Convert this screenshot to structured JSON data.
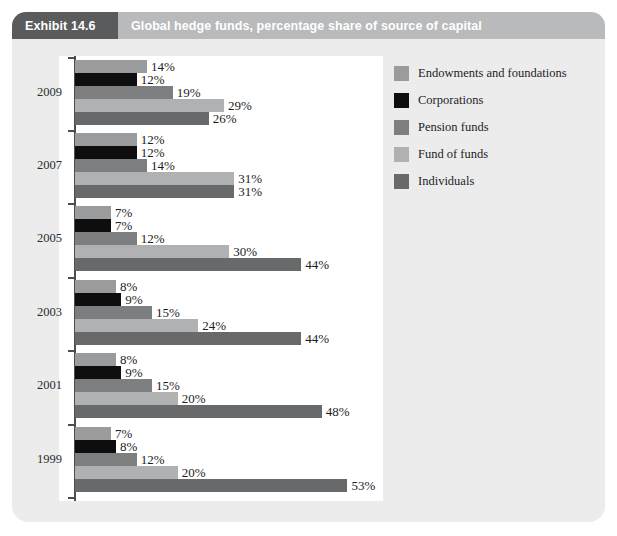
{
  "header": {
    "exhibit_tag": "Exhibit 14.6",
    "title": "Global hedge funds, percentage share of source of capital"
  },
  "legend": {
    "position": "right",
    "items": [
      {
        "label": "Endowments and foundations",
        "color": "#9a9b9d"
      },
      {
        "label": "Corporations",
        "color": "#0e0e0e"
      },
      {
        "label": "Pension funds",
        "color": "#7d7e80"
      },
      {
        "label": "Fund of funds",
        "color": "#b0b1b3"
      },
      {
        "label": "Individuals",
        "color": "#68696b"
      }
    ]
  },
  "chart_data": {
    "type": "bar",
    "orientation": "horizontal",
    "title": "Global hedge funds, percentage share of source of capital",
    "xlabel": "",
    "ylabel": "",
    "xlim": [
      0,
      60
    ],
    "grid": false,
    "value_suffix": "%",
    "categories": [
      "2009",
      "2007",
      "2005",
      "2003",
      "2001",
      "1999"
    ],
    "series": [
      {
        "name": "Endowments and foundations",
        "color": "#9a9b9d",
        "values": [
          14,
          12,
          7,
          8,
          8,
          7
        ]
      },
      {
        "name": "Corporations",
        "color": "#0e0e0e",
        "values": [
          12,
          12,
          7,
          9,
          9,
          8
        ]
      },
      {
        "name": "Pension funds",
        "color": "#7d7e80",
        "values": [
          19,
          14,
          12,
          15,
          15,
          12
        ]
      },
      {
        "name": "Fund of funds",
        "color": "#b0b1b3",
        "values": [
          29,
          31,
          30,
          24,
          20,
          20
        ]
      },
      {
        "name": "Individuals",
        "color": "#68696b",
        "values": [
          26,
          31,
          44,
          44,
          48,
          53
        ]
      }
    ],
    "labels": {
      "2009": [
        "14%",
        "12%",
        "19%",
        "29%",
        "26%"
      ],
      "2007": [
        "12%",
        "12%",
        "14%",
        "31%",
        "31%"
      ],
      "2005": [
        "7%",
        "7%",
        "12%",
        "30%",
        "44%"
      ],
      "2003": [
        "8%",
        "9%",
        "15%",
        "24%",
        "44%"
      ],
      "2001": [
        "8%",
        "9%",
        "15%",
        "20%",
        "48%"
      ],
      "1999": [
        "7%",
        "8%",
        "12%",
        "20%",
        "53%"
      ]
    }
  },
  "layout": {
    "plot_left_px": 75,
    "px_per_percent": 5.14,
    "bar_height_px": 13,
    "group_top_px": [
      60,
      133,
      206,
      280,
      353,
      427
    ],
    "tick_y_px": [
      57,
      130,
      203,
      277,
      350,
      424,
      497
    ]
  },
  "colors": {
    "card_background": "#ececed",
    "plot_background": "#ffffff",
    "tag_background": "#5a5b5d",
    "title_background": "#b9babc",
    "axis": "#4c4d4f",
    "text": "#1d1d1d"
  }
}
